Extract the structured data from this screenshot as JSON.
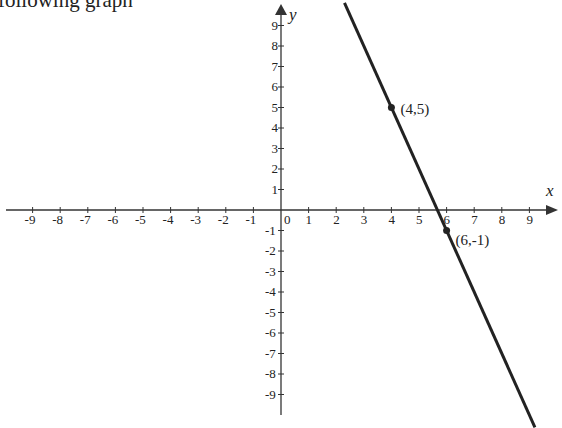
{
  "caption": "following graph",
  "chart_data": {
    "type": "line",
    "title": "",
    "xlabel": "x",
    "ylabel": "y",
    "xlim": [
      -9.5,
      10
    ],
    "ylim": [
      -10,
      10
    ],
    "x_ticks": [
      -9,
      -8,
      -7,
      -6,
      -5,
      -4,
      -3,
      -2,
      -1,
      0,
      1,
      2,
      3,
      4,
      5,
      6,
      7,
      8,
      9
    ],
    "y_ticks": [
      9,
      8,
      7,
      6,
      5,
      4,
      3,
      2,
      1,
      -1,
      -2,
      -3,
      -4,
      -5,
      -6,
      -7,
      -8,
      -9
    ],
    "grid": false,
    "series": [
      {
        "name": "line",
        "equation": "y = -3x + 17",
        "x": [
          2.3,
          9.2
        ],
        "y": [
          10.1,
          -10.6
        ]
      }
    ],
    "points": [
      {
        "x": 4,
        "y": 5,
        "label": "(4,5)"
      },
      {
        "x": 6,
        "y": -1,
        "label": "(6,-1)"
      }
    ]
  },
  "colors": {
    "axis": "#333333",
    "line": "#222222",
    "text": "#222222"
  }
}
